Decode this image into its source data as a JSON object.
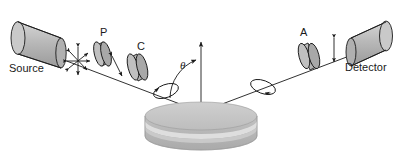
{
  "figure": {
    "labels": {
      "source": "Source",
      "polarizer": "P",
      "compensator": "C",
      "analyzer": "A",
      "detector": "Detector",
      "angle": "θ"
    },
    "colors": {
      "stroke": "#1a1a1a",
      "cylinder_face": "#b3b3b3",
      "cylinder_body": "#a6a6a6",
      "cylinder_light": "#cccccc",
      "optic_face": "#bfbfbf",
      "optic_edge": "#8c8c8c",
      "sample_top": "#c4c4c4",
      "sample_band_light": "#dedede",
      "sample_band_mid": "#bdbdbd",
      "sample_side": "#b0b0b0",
      "background": "#ffffff"
    },
    "elements": [
      {
        "name": "light-source",
        "kind": "cylinder",
        "label": "Source"
      },
      {
        "name": "unpolarized-light-symbol",
        "kind": "arrow-star"
      },
      {
        "name": "polarizer-disk",
        "kind": "disk",
        "label": "P"
      },
      {
        "name": "linear-polarization-arrow",
        "kind": "double-arrow"
      },
      {
        "name": "compensator-disk",
        "kind": "disk",
        "label": "C"
      },
      {
        "name": "elliptical-polarization-incident",
        "kind": "ellipse"
      },
      {
        "name": "sample-stage",
        "kind": "layered-cylinder"
      },
      {
        "name": "surface-normal",
        "kind": "vertical-line"
      },
      {
        "name": "incidence-angle-arc",
        "kind": "arc",
        "label": "θ"
      },
      {
        "name": "elliptical-polarization-reflected",
        "kind": "ellipse"
      },
      {
        "name": "analyzer-disk",
        "kind": "disk",
        "label": "A"
      },
      {
        "name": "transmitted-polarization-arrow",
        "kind": "double-arrow"
      },
      {
        "name": "detector",
        "kind": "cylinder",
        "label": "Detector"
      }
    ]
  }
}
